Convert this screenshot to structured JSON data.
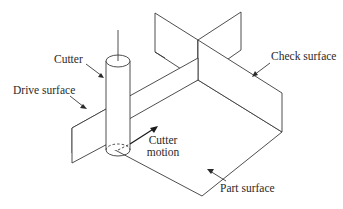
{
  "diagram": {
    "type": "isometric-machining-surfaces",
    "labels": {
      "cutter": "Cutter",
      "drive_surface": "Drive surface",
      "check_surface": "Check surface",
      "cutter_motion_line1": "Cutter",
      "cutter_motion_line2": "motion",
      "part_surface": "Part surface"
    },
    "colors": {
      "line": "#3a3a3a",
      "text": "#2a2a2a",
      "background": "#ffffff"
    }
  }
}
